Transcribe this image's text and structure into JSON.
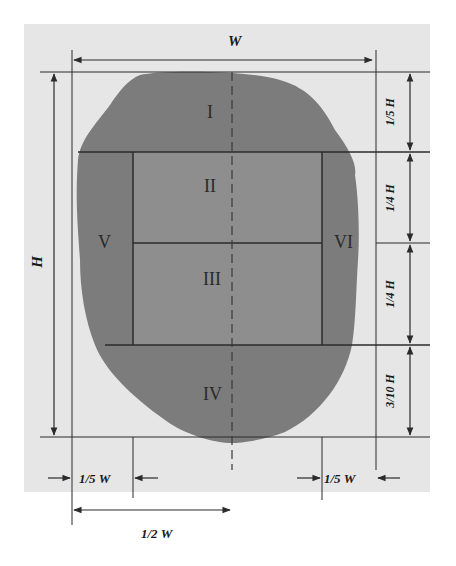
{
  "figure": {
    "colors": {
      "background_panel": "#e6e6e6",
      "specimen_fill": "#7c7c7c",
      "center_fill": "#8e8e8e",
      "line": "#2b2b2b",
      "text": "#1a1a1a"
    },
    "dimensions": {
      "width_label": "W",
      "height_label": "H",
      "right_segments": [
        "1/5 H",
        "1/4 H",
        "1/4 H",
        "3/10 H"
      ],
      "bottom_left_offset": "1/5 W",
      "bottom_right_offset": "1/5 W",
      "bottom_half": "1/2 W"
    },
    "regions": [
      {
        "id": "I",
        "label": "I"
      },
      {
        "id": "II",
        "label": "II"
      },
      {
        "id": "III",
        "label": "III"
      },
      {
        "id": "IV",
        "label": "IV"
      },
      {
        "id": "V",
        "label": "V"
      },
      {
        "id": "VI",
        "label": "VI"
      }
    ]
  }
}
